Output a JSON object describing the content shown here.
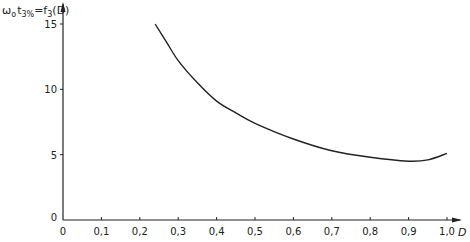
{
  "chart_data": {
    "type": "line",
    "title": "",
    "ylabel": "ω₀t₃% = f₃(D)",
    "xlabel": "D",
    "xlim": [
      0,
      1.0
    ],
    "ylim": [
      0,
      15
    ],
    "grid": false,
    "x_ticks": [
      0,
      0.1,
      0.2,
      0.3,
      0.4,
      0.5,
      0.6,
      0.7,
      0.8,
      0.9,
      1.0
    ],
    "x_tick_labels": [
      "0",
      "0,1",
      "0,2",
      "0,3",
      "0,4",
      "0,5",
      "0,6",
      "0,7",
      "0,8",
      "0,9",
      "1,0"
    ],
    "y_ticks": [
      0,
      5,
      10,
      15
    ],
    "y_tick_labels": [
      "0",
      "5",
      "10",
      "15"
    ],
    "series": [
      {
        "name": "f3(D)",
        "x": [
          0.24,
          0.27,
          0.3,
          0.35,
          0.4,
          0.45,
          0.5,
          0.6,
          0.7,
          0.8,
          0.9,
          0.95,
          1.0
        ],
        "values": [
          15.0,
          13.6,
          12.2,
          10.5,
          9.1,
          8.2,
          7.4,
          6.2,
          5.3,
          4.8,
          4.5,
          4.6,
          5.1
        ],
        "color": "#222222"
      }
    ]
  },
  "labels": {
    "y_axis_main": "ω",
    "y_axis_sub0": "o",
    "y_axis_t": "t",
    "y_axis_sub1": "3%",
    "y_axis_eq": "=f",
    "y_axis_sub2": "3",
    "y_axis_arg": "(D)",
    "x_axis": "D"
  },
  "colors": {
    "line": "#222222",
    "axis": "#222222",
    "background": "#ffffff"
  }
}
